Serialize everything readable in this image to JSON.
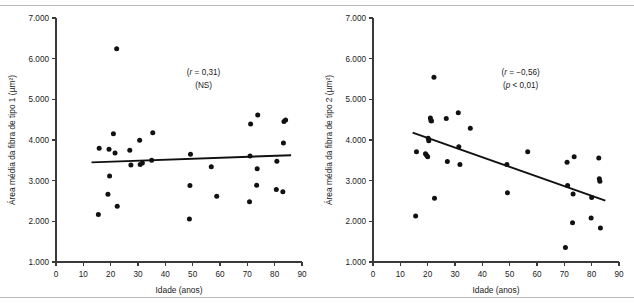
{
  "figure": {
    "panel_count": 2,
    "ink_color": "#111111",
    "rule_color": "#b6b8ba"
  },
  "chart_data": [
    {
      "type": "scatter",
      "panel": "left",
      "title": "",
      "xlabel": "Idade (anos)",
      "ylabel": "Área média da fibra de tipo 1 (µm²)",
      "xlim": [
        0,
        90
      ],
      "ylim": [
        1000,
        7000
      ],
      "xticks": [
        0,
        10,
        20,
        30,
        40,
        50,
        60,
        70,
        80,
        90
      ],
      "xticklabels": [
        "0",
        "10",
        "20",
        "30",
        "40",
        "50",
        "60",
        "70",
        "80",
        "90"
      ],
      "yticks": [
        1000,
        2000,
        3000,
        4000,
        5000,
        6000,
        7000
      ],
      "yticklabels": [
        "1.000",
        "2.000",
        "3.000",
        "4.000",
        "5.000",
        "6.000",
        "7.000"
      ],
      "grid": false,
      "legend": "none",
      "annotations": [
        {
          "text": "(r = 0,31)",
          "stat_symbol": "r",
          "value": "0,31"
        },
        {
          "text": "(NS)",
          "stat_symbol": "",
          "value": "NS"
        }
      ],
      "correlation_r": 0.31,
      "significance": "NS",
      "fit_line": {
        "x0": 13.0,
        "y0": 3450,
        "x1": 86.0,
        "y1": 3625
      },
      "points": [
        {
          "x": 15.5,
          "y": 2165
        },
        {
          "x": 15.8,
          "y": 3795
        },
        {
          "x": 19.0,
          "y": 2665
        },
        {
          "x": 19.4,
          "y": 3775
        },
        {
          "x": 19.6,
          "y": 3115
        },
        {
          "x": 21.0,
          "y": 4155
        },
        {
          "x": 21.6,
          "y": 3680
        },
        {
          "x": 22.2,
          "y": 6245
        },
        {
          "x": 22.4,
          "y": 2370
        },
        {
          "x": 27.0,
          "y": 3745
        },
        {
          "x": 27.4,
          "y": 3385
        },
        {
          "x": 30.6,
          "y": 3995
        },
        {
          "x": 30.8,
          "y": 3400
        },
        {
          "x": 31.6,
          "y": 3435
        },
        {
          "x": 35.0,
          "y": 3505
        },
        {
          "x": 35.4,
          "y": 4180
        },
        {
          "x": 48.8,
          "y": 2060
        },
        {
          "x": 49.0,
          "y": 2880
        },
        {
          "x": 49.2,
          "y": 3650
        },
        {
          "x": 56.8,
          "y": 3345
        },
        {
          "x": 58.8,
          "y": 2615
        },
        {
          "x": 70.8,
          "y": 2480
        },
        {
          "x": 71.0,
          "y": 3605
        },
        {
          "x": 71.2,
          "y": 4395
        },
        {
          "x": 73.4,
          "y": 2885
        },
        {
          "x": 73.6,
          "y": 3295
        },
        {
          "x": 73.8,
          "y": 4615
        },
        {
          "x": 80.6,
          "y": 2780
        },
        {
          "x": 80.8,
          "y": 3480
        },
        {
          "x": 83.0,
          "y": 2730
        },
        {
          "x": 83.2,
          "y": 3925
        },
        {
          "x": 83.4,
          "y": 4455
        },
        {
          "x": 84.0,
          "y": 4490
        }
      ]
    },
    {
      "type": "scatter",
      "panel": "right",
      "title": "",
      "xlabel": "Idade (anos)",
      "ylabel": "Área média da fibra de tipo 2 (µm²)",
      "xlim": [
        0,
        90
      ],
      "ylim": [
        1000,
        7000
      ],
      "xticks": [
        0,
        10,
        20,
        30,
        40,
        50,
        60,
        70,
        80,
        90
      ],
      "xticklabels": [
        "0",
        "10",
        "20",
        "30",
        "40",
        "50",
        "60",
        "70",
        "80",
        "90"
      ],
      "yticks": [
        1000,
        2000,
        3000,
        4000,
        5000,
        6000,
        7000
      ],
      "yticklabels": [
        "1.000",
        "2.000",
        "3.000",
        "4.000",
        "5.000",
        "6.000",
        "7.000"
      ],
      "grid": false,
      "legend": "none",
      "annotations": [
        {
          "text": "(r = −0,56)",
          "stat_symbol": "r",
          "value": "−0,56"
        },
        {
          "text": "(p < 0,01)",
          "stat_symbol": "p",
          "value": "< 0,01"
        }
      ],
      "correlation_r": -0.56,
      "significance": "p < 0,01",
      "fit_line": {
        "x0": 14.5,
        "y0": 4180,
        "x1": 85.0,
        "y1": 2510
      },
      "points": [
        {
          "x": 15.6,
          "y": 2130
        },
        {
          "x": 15.9,
          "y": 3710
        },
        {
          "x": 19.2,
          "y": 3660
        },
        {
          "x": 19.6,
          "y": 3625
        },
        {
          "x": 20.0,
          "y": 3590
        },
        {
          "x": 20.2,
          "y": 4040
        },
        {
          "x": 20.4,
          "y": 3980
        },
        {
          "x": 21.0,
          "y": 4540
        },
        {
          "x": 21.2,
          "y": 4480
        },
        {
          "x": 21.4,
          "y": 4470
        },
        {
          "x": 22.3,
          "y": 5545
        },
        {
          "x": 22.5,
          "y": 2565
        },
        {
          "x": 26.8,
          "y": 4530
        },
        {
          "x": 27.2,
          "y": 3470
        },
        {
          "x": 31.2,
          "y": 4670
        },
        {
          "x": 31.4,
          "y": 3835
        },
        {
          "x": 31.8,
          "y": 3400
        },
        {
          "x": 35.6,
          "y": 4290
        },
        {
          "x": 49.0,
          "y": 3395
        },
        {
          "x": 49.2,
          "y": 2700
        },
        {
          "x": 56.6,
          "y": 3710
        },
        {
          "x": 70.4,
          "y": 1355
        },
        {
          "x": 71.0,
          "y": 3450
        },
        {
          "x": 71.2,
          "y": 2880
        },
        {
          "x": 73.0,
          "y": 1965
        },
        {
          "x": 73.2,
          "y": 2675
        },
        {
          "x": 73.6,
          "y": 3590
        },
        {
          "x": 79.8,
          "y": 2085
        },
        {
          "x": 80.0,
          "y": 2585
        },
        {
          "x": 82.6,
          "y": 3560
        },
        {
          "x": 82.8,
          "y": 3045
        },
        {
          "x": 83.0,
          "y": 2985
        },
        {
          "x": 83.2,
          "y": 1835
        }
      ]
    }
  ]
}
